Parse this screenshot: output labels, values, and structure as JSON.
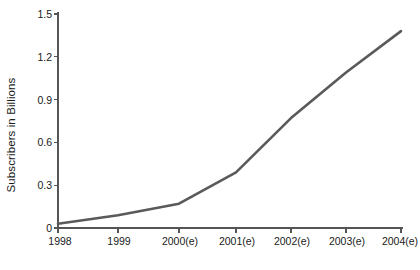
{
  "chart_data": {
    "type": "line",
    "title": "",
    "xlabel": "",
    "ylabel": "Subscribers in Billions",
    "categories": [
      "1998",
      "1999",
      "2000(e)",
      "2001(e)",
      "2002(e)",
      "2003(e)",
      "2004(e)"
    ],
    "values": [
      0.03,
      0.09,
      0.17,
      0.39,
      0.77,
      1.09,
      1.38
    ],
    "series": [
      {
        "name": "Subscribers",
        "values": [
          0.03,
          0.09,
          0.17,
          0.39,
          0.77,
          1.09,
          1.38
        ]
      }
    ],
    "ylim": [
      0,
      1.5
    ],
    "yticks": [
      "0",
      "0.3",
      "0.6",
      "0.9",
      "1.2",
      "1.5"
    ],
    "ytick_values": [
      0,
      0.3,
      0.6,
      0.9,
      1.2,
      1.5
    ],
    "xticks": [
      "1998",
      "1999",
      "2000(e)",
      "2001(e)",
      "2002(e)",
      "2003(e)",
      "2004(e)"
    ],
    "grid": false,
    "legend": false,
    "legend_position": "none",
    "line_color": "#5a5a5a",
    "axis_color": "#555555",
    "background_color": "#ffffff",
    "markers": false,
    "annotations": []
  },
  "axes": {
    "y_title": "Subscribers in Billions"
  }
}
